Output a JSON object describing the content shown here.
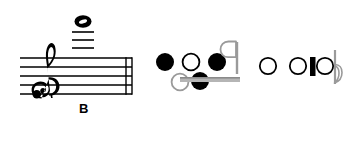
{
  "figure": {
    "kind": "music-notation-diagram",
    "background_color": "#ffffff",
    "ink_color": "#000000",
    "staff": {
      "clef": "treble-clef",
      "line_count": 5,
      "ledger_line_count": 3,
      "barline": "thin-double-barline",
      "note_value": "whole-note",
      "note_position": "three-ledger-lines-above-staff",
      "pitch_label": "B",
      "clef_dot": "ornament-dot"
    },
    "symbol_groups": [
      {
        "name": "middle-cluster",
        "symbols": [
          {
            "name": "filled-notehead",
            "fill": "solid"
          },
          {
            "name": "hollow-notehead",
            "fill": "hollow"
          },
          {
            "name": "filled-notehead",
            "fill": "solid"
          },
          {
            "name": "eighth-note-flag-stem",
            "fill": "hollow"
          },
          {
            "name": "hollow-notehead",
            "fill": "hollow"
          },
          {
            "name": "filled-notehead",
            "fill": "solid"
          },
          {
            "name": "beam-bar",
            "fill": "solid"
          }
        ]
      },
      {
        "name": "right-cluster",
        "symbols": [
          {
            "name": "hollow-notehead",
            "fill": "hollow"
          },
          {
            "name": "hollow-notehead",
            "fill": "hollow"
          },
          {
            "name": "thick-vertical-bar",
            "fill": "solid"
          },
          {
            "name": "hollow-notehead",
            "fill": "hollow"
          },
          {
            "name": "eighth-note-flag-stem",
            "fill": "hollow"
          }
        ]
      }
    ]
  }
}
